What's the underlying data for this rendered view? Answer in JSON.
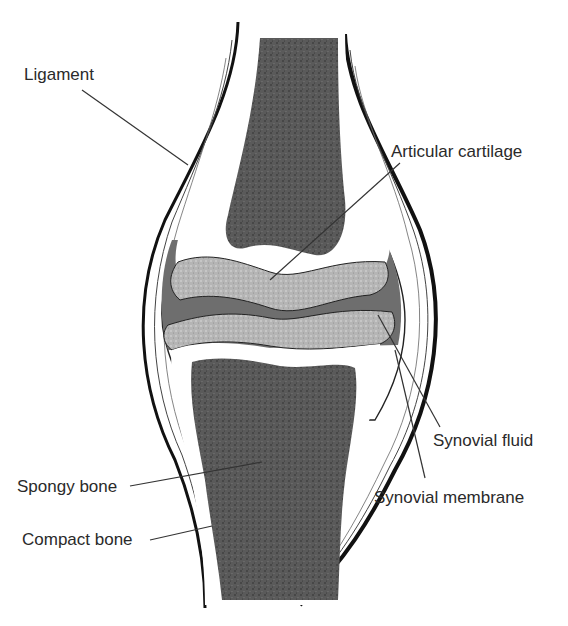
{
  "diagram": {
    "colors": {
      "bone_marrow": "#5a5a5a",
      "cartilage": "#b8b8b8",
      "synovial_cavity": "#6e6e6e",
      "compact_bone": "#ffffff",
      "outline": "#111111",
      "leader": "#333333"
    },
    "labels": [
      {
        "id": "ligament",
        "text": "Ligament"
      },
      {
        "id": "articular_cartilage",
        "text": "Articular cartilage"
      },
      {
        "id": "synovial_fluid",
        "text": "Synovial fluid"
      },
      {
        "id": "synovial_membrane",
        "text": "Synovial membrane"
      },
      {
        "id": "spongy_bone",
        "text": "Spongy bone"
      },
      {
        "id": "compact_bone",
        "text": "Compact bone"
      }
    ]
  }
}
